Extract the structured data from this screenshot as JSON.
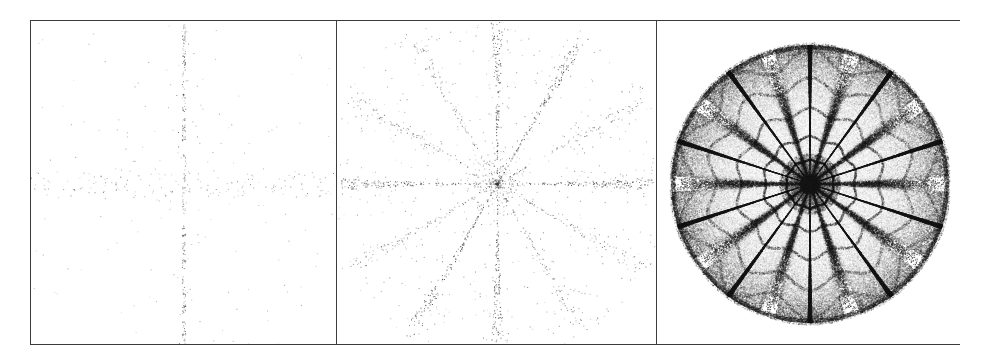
{
  "figure": {
    "name": "three-panel-point-pattern-figure",
    "width": 990,
    "height": 359,
    "background_color": "#ffffff",
    "border_color": "#3b3b3b",
    "border_width_px": 1.6,
    "frame": {
      "x": 30,
      "y": 20,
      "width": 930,
      "height": 325
    },
    "panel_count": 3,
    "panel_divider_x": [
      335,
      655
    ]
  },
  "panels": [
    {
      "id": "panel-left",
      "label": "",
      "x": 30,
      "y": 20,
      "width": 305,
      "height": 325,
      "pattern": "sparse-cross-scatter",
      "description": "Very sparse scattered points forming a faint vertical spine and a horizontal band crossing near the centre",
      "point_count": 520,
      "point_color": "#555555",
      "point_size_px": 1.0,
      "center": {
        "x": 0.5,
        "y": 0.52
      },
      "axes": 4,
      "spine_strength": 0.62,
      "radial_falloff": 2.4,
      "seed": 10771
    },
    {
      "id": "panel-middle",
      "label": "",
      "x": 335,
      "y": 20,
      "width": 320,
      "height": 325,
      "pattern": "twelve-spoke-starburst",
      "description": "Radial starburst of dotted rays, roughly twelve spokes, dots densest near the centre and along the ray lines",
      "point_count": 2600,
      "point_color": "#3a3a3a",
      "point_size_px": 1.0,
      "center": {
        "x": 0.5,
        "y": 0.5
      },
      "axes": 12,
      "spoke_sharpness": 18,
      "outer_radius_frac": 0.47,
      "seed": 24509
    },
    {
      "id": "panel-right",
      "label": "",
      "x": 655,
      "y": 20,
      "width": 305,
      "height": 325,
      "pattern": "ten-fold-rosette-caustic",
      "description": "Dense filled disc with ten dark radial caustic spokes, nested concentric ring structures and a dark core",
      "point_count": 150000,
      "point_color": "#1a1a1a",
      "point_size_px": 1.0,
      "center": {
        "x": 0.5,
        "y": 0.5
      },
      "axes": 10,
      "rings": [
        0.17,
        0.33,
        0.52,
        0.72,
        0.9,
        1.0
      ],
      "disc_center_px": {
        "x": 806,
        "y": 181
      },
      "disc_radius_px": 139,
      "seed": 99137
    }
  ]
}
